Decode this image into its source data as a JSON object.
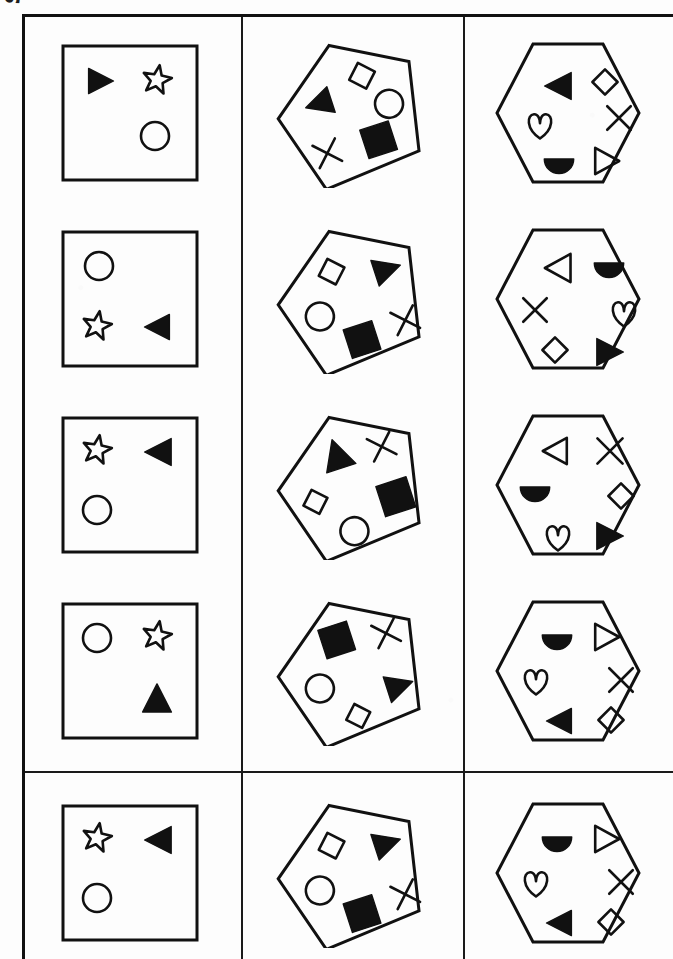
{
  "page": {
    "width": 673,
    "height": 959,
    "background_color": "#ffffff",
    "ink_color": "#111111",
    "margin_note": "sapera"
  },
  "layout": {
    "frame": {
      "left": 22,
      "top": 14,
      "border_width_px": 3
    },
    "column_dividers_x": [
      218,
      440
    ],
    "section_divider_y": 768,
    "columns": 3,
    "rows": 5,
    "column_labels": [
      "square-figure",
      "pentagon-figure",
      "hexagon-figure"
    ]
  },
  "legend": {
    "shape_names": [
      "triangle-right-filled",
      "triangle-left-filled",
      "triangle-up-filled",
      "triangle-right-outline",
      "triangle-left-outline",
      "star-outline",
      "circle-outline",
      "diamond-outline",
      "cross-x",
      "square-filled",
      "heart-outline",
      "semicircle-filled"
    ]
  },
  "rows": [
    {
      "index": 1,
      "cells": [
        {
          "container": "square",
          "rotation": 0,
          "shapes": [
            {
              "name": "triangle-right-filled",
              "x": 30,
              "y": 28,
              "size": 30
            },
            {
              "name": "star-outline",
              "x": 86,
              "y": 26,
              "size": 32
            },
            {
              "name": "circle-outline",
              "x": 84,
              "y": 82,
              "size": 32
            }
          ]
        },
        {
          "container": "pentagon",
          "rotation": -18,
          "shapes": [
            {
              "name": "triangle-left-filled",
              "x": 32,
              "y": 40,
              "size": 32
            },
            {
              "name": "diamond-outline",
              "x": 82,
              "y": 28,
              "size": 30
            },
            {
              "name": "circle-outline",
              "x": 98,
              "y": 62,
              "size": 32
            },
            {
              "name": "cross-x",
              "x": 26,
              "y": 92,
              "size": 28
            },
            {
              "name": "square-filled",
              "x": 76,
              "y": 92,
              "size": 34
            }
          ]
        },
        {
          "container": "hexagon",
          "rotation": 0,
          "shapes": [
            {
              "name": "triangle-left-filled",
              "x": 50,
              "y": 32,
              "size": 32
            },
            {
              "name": "diamond-outline",
              "x": 98,
              "y": 30,
              "size": 28
            },
            {
              "name": "heart-outline",
              "x": 32,
              "y": 72,
              "size": 30
            },
            {
              "name": "cross-x",
              "x": 112,
              "y": 66,
              "size": 28
            },
            {
              "name": "semicircle-filled",
              "x": 50,
              "y": 110,
              "size": 32
            },
            {
              "name": "triangle-right-outline",
              "x": 98,
              "y": 108,
              "size": 30
            }
          ]
        }
      ]
    },
    {
      "index": 2,
      "cells": [
        {
          "container": "square",
          "rotation": 0,
          "shapes": [
            {
              "name": "circle-outline",
              "x": 28,
              "y": 26,
              "size": 32
            },
            {
              "name": "star-outline",
              "x": 26,
              "y": 86,
              "size": 32
            },
            {
              "name": "triangle-left-filled",
              "x": 88,
              "y": 88,
              "size": 30
            }
          ]
        },
        {
          "container": "pentagon",
          "rotation": -18,
          "shapes": [
            {
              "name": "diamond-outline",
              "x": 50,
              "y": 28,
              "size": 30
            },
            {
              "name": "triangle-right-filled",
              "x": 102,
              "y": 42,
              "size": 32
            },
            {
              "name": "circle-outline",
              "x": 24,
              "y": 66,
              "size": 32
            },
            {
              "name": "square-filled",
              "x": 56,
              "y": 100,
              "size": 34
            },
            {
              "name": "cross-x",
              "x": 106,
              "y": 98,
              "size": 28
            }
          ]
        },
        {
          "container": "hexagon",
          "rotation": 0,
          "shapes": [
            {
              "name": "triangle-left-outline",
              "x": 50,
              "y": 28,
              "size": 32
            },
            {
              "name": "semicircle-filled",
              "x": 100,
              "y": 28,
              "size": 32
            },
            {
              "name": "cross-x",
              "x": 28,
              "y": 72,
              "size": 28
            },
            {
              "name": "heart-outline",
              "x": 116,
              "y": 74,
              "size": 30
            },
            {
              "name": "diamond-outline",
              "x": 48,
              "y": 112,
              "size": 28
            },
            {
              "name": "triangle-right-filled",
              "x": 100,
              "y": 112,
              "size": 32
            }
          ]
        }
      ]
    },
    {
      "index": 3,
      "cells": [
        {
          "container": "square",
          "rotation": 0,
          "shapes": [
            {
              "name": "star-outline",
              "x": 26,
              "y": 24,
              "size": 32
            },
            {
              "name": "triangle-left-filled",
              "x": 88,
              "y": 26,
              "size": 32
            },
            {
              "name": "circle-outline",
              "x": 26,
              "y": 84,
              "size": 32
            }
          ]
        },
        {
          "container": "pentagon",
          "rotation": -18,
          "shapes": [
            {
              "name": "triangle-up-filled",
              "x": 54,
              "y": 24,
              "size": 34
            },
            {
              "name": "cross-x",
              "x": 102,
              "y": 34,
              "size": 28
            },
            {
              "name": "diamond-outline",
              "x": 22,
              "y": 66,
              "size": 28
            },
            {
              "name": "square-filled",
              "x": 96,
              "y": 82,
              "size": 36
            },
            {
              "name": "circle-outline",
              "x": 48,
              "y": 104,
              "size": 32
            }
          ]
        },
        {
          "container": "hexagon",
          "rotation": 0,
          "shapes": [
            {
              "name": "triangle-left-outline",
              "x": 48,
              "y": 26,
              "size": 30
            },
            {
              "name": "cross-x",
              "x": 102,
              "y": 26,
              "size": 30
            },
            {
              "name": "semicircle-filled",
              "x": 26,
              "y": 66,
              "size": 32
            },
            {
              "name": "diamond-outline",
              "x": 114,
              "y": 72,
              "size": 28
            },
            {
              "name": "heart-outline",
              "x": 50,
              "y": 112,
              "size": 30
            },
            {
              "name": "triangle-right-filled",
              "x": 100,
              "y": 110,
              "size": 32
            }
          ]
        }
      ]
    },
    {
      "index": 4,
      "cells": [
        {
          "container": "square",
          "rotation": 0,
          "shapes": [
            {
              "name": "circle-outline",
              "x": 26,
              "y": 26,
              "size": 32
            },
            {
              "name": "star-outline",
              "x": 86,
              "y": 24,
              "size": 32
            },
            {
              "name": "triangle-up-filled",
              "x": 86,
              "y": 86,
              "size": 32
            }
          ]
        },
        {
          "container": "pentagon",
          "rotation": -18,
          "shapes": [
            {
              "name": "square-filled",
              "x": 54,
              "y": 24,
              "size": 34
            },
            {
              "name": "cross-x",
              "x": 106,
              "y": 36,
              "size": 28
            },
            {
              "name": "circle-outline",
              "x": 24,
              "y": 66,
              "size": 32
            },
            {
              "name": "triangle-right-filled",
              "x": 100,
              "y": 88,
              "size": 32
            },
            {
              "name": "diamond-outline",
              "x": 54,
              "y": 106,
              "size": 28
            }
          ]
        },
        {
          "container": "hexagon",
          "rotation": 0,
          "shapes": [
            {
              "name": "semicircle-filled",
              "x": 48,
              "y": 28,
              "size": 32
            },
            {
              "name": "triangle-right-outline",
              "x": 98,
              "y": 26,
              "size": 30
            },
            {
              "name": "heart-outline",
              "x": 28,
              "y": 70,
              "size": 30
            },
            {
              "name": "cross-x",
              "x": 114,
              "y": 70,
              "size": 28
            },
            {
              "name": "triangle-left-filled",
              "x": 52,
              "y": 110,
              "size": 30
            },
            {
              "name": "diamond-outline",
              "x": 104,
              "y": 110,
              "size": 28
            }
          ]
        }
      ]
    },
    {
      "index": 5,
      "cells": [
        {
          "container": "square",
          "rotation": 0,
          "shapes": [
            {
              "name": "star-outline",
              "x": 26,
              "y": 24,
              "size": 32
            },
            {
              "name": "triangle-left-filled",
              "x": 88,
              "y": 26,
              "size": 32
            },
            {
              "name": "circle-outline",
              "x": 26,
              "y": 84,
              "size": 32
            }
          ]
        },
        {
          "container": "pentagon",
          "rotation": -18,
          "shapes": [
            {
              "name": "diamond-outline",
              "x": 50,
              "y": 28,
              "size": 30
            },
            {
              "name": "triangle-right-filled",
              "x": 102,
              "y": 42,
              "size": 32
            },
            {
              "name": "circle-outline",
              "x": 24,
              "y": 66,
              "size": 32
            },
            {
              "name": "square-filled",
              "x": 56,
              "y": 100,
              "size": 34
            },
            {
              "name": "cross-x",
              "x": 106,
              "y": 98,
              "size": 28
            }
          ]
        },
        {
          "container": "hexagon",
          "rotation": 0,
          "shapes": [
            {
              "name": "semicircle-filled",
              "x": 48,
              "y": 28,
              "size": 32
            },
            {
              "name": "triangle-right-outline",
              "x": 98,
              "y": 26,
              "size": 30
            },
            {
              "name": "heart-outline",
              "x": 28,
              "y": 70,
              "size": 30
            },
            {
              "name": "cross-x",
              "x": 114,
              "y": 70,
              "size": 28
            },
            {
              "name": "triangle-left-filled",
              "x": 52,
              "y": 110,
              "size": 30
            },
            {
              "name": "diamond-outline",
              "x": 104,
              "y": 110,
              "size": 28
            }
          ]
        }
      ]
    }
  ]
}
